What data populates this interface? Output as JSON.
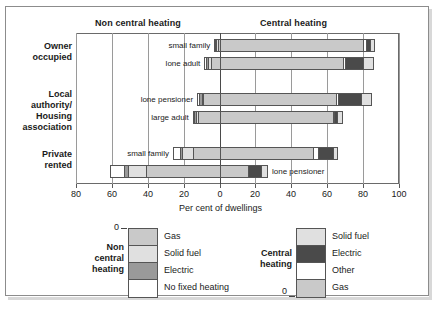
{
  "header": {
    "left_band": "Non central heating",
    "right_band": "Central heating"
  },
  "axis": {
    "title": "Per cent of dwellings",
    "ticks": [
      "80",
      "60",
      "40",
      "20",
      "0",
      "20",
      "40",
      "60",
      "80",
      "100"
    ]
  },
  "categories": [
    {
      "label_lines": [
        "Owner",
        "occupied"
      ]
    },
    {
      "label_lines": [
        "Local",
        "authority/",
        "Housing",
        "association"
      ]
    },
    {
      "label_lines": [
        "Private",
        "rented"
      ]
    }
  ],
  "bar_labels": [
    "small family",
    "lone adult",
    "lone pensioner",
    "large adult",
    "small family",
    "lone pensioner"
  ],
  "legends": {
    "left": {
      "name_lines": [
        "Non",
        "central",
        "heating"
      ],
      "zero_label": "0",
      "items": [
        {
          "label": "Gas",
          "color": "#c9c9c9"
        },
        {
          "label": "Solid fuel",
          "color": "#e0e0e0"
        },
        {
          "label": "Electric",
          "color": "#9a9a9a"
        },
        {
          "label": "No fixed heating",
          "color": "#ffffff"
        }
      ]
    },
    "right": {
      "name_lines": [
        "Central",
        "heating"
      ],
      "zero_label": "0",
      "items": [
        {
          "label": "Solid fuel",
          "color": "#e0e0e0"
        },
        {
          "label": "Electric",
          "color": "#4a4a4a"
        },
        {
          "label": "Other",
          "color": "#ffffff"
        },
        {
          "label": "Gas",
          "color": "#c9c9c9"
        }
      ]
    }
  },
  "chart_data": {
    "type": "bar",
    "orientation": "horizontal",
    "layout": "diverging-stacked",
    "title": "",
    "xlabel": "Per cent of dwellings",
    "ylabel": "",
    "grid": true,
    "legend_position": "below",
    "xlim_left": [
      0,
      80
    ],
    "xlim_right": [
      0,
      100
    ],
    "x_ticks": [
      -80,
      -60,
      -40,
      -20,
      0,
      20,
      40,
      60,
      80,
      100
    ],
    "x_tick_labels": [
      "80",
      "60",
      "40",
      "20",
      "0",
      "20",
      "40",
      "60",
      "80",
      "100"
    ],
    "groups": [
      "Owner occupied",
      "Local authority/ Housing association",
      "Private rented"
    ],
    "rows": [
      {
        "group": "Owner occupied",
        "household": "small family",
        "non_central_heating": {
          "No fixed heating": 0.5,
          "Electric": 0.5,
          "Solid fuel": 1.0,
          "Gas": 1.0
        },
        "central_heating": {
          "Gas": 80.0,
          "Other": 1.5,
          "Electric": 2.0,
          "Solid fuel": 3.0
        }
      },
      {
        "group": "Owner occupied",
        "household": "lone adult",
        "non_central_heating": {
          "No fixed heating": 1.0,
          "Electric": 1.0,
          "Solid fuel": 1.5,
          "Gas": 5.0
        },
        "central_heating": {
          "Gas": 69.0,
          "Other": 1.0,
          "Electric": 10.0,
          "Solid fuel": 6.0
        }
      },
      {
        "group": "Local authority/ Housing association",
        "household": "lone pensioner",
        "non_central_heating": {
          "No fixed heating": 1.0,
          "Electric": 1.5,
          "Solid fuel": 1.0,
          "Gas": 9.0
        },
        "central_heating": {
          "Gas": 65.0,
          "Other": 1.0,
          "Electric": 13.0,
          "Solid fuel": 6.0
        }
      },
      {
        "group": "Local authority/ Housing association",
        "household": "large adult",
        "non_central_heating": {
          "No fixed heating": 1.0,
          "Electric": 1.0,
          "Solid fuel": 1.0,
          "Gas": 12.0
        },
        "central_heating": {
          "Gas": 63.0,
          "Other": 0.5,
          "Electric": 2.0,
          "Solid fuel": 3.0
        }
      },
      {
        "group": "Private rented",
        "household": "small family",
        "non_central_heating": {
          "No fixed heating": 4.0,
          "Electric": 1.0,
          "Solid fuel": 6.0,
          "Gas": 15.0
        },
        "central_heating": {
          "Gas": 52.0,
          "Other": 3.0,
          "Electric": 8.0,
          "Solid fuel": 3.0
        }
      },
      {
        "group": "Private rented",
        "household": "lone pensioner",
        "non_central_heating": {
          "No fixed heating": 8.0,
          "Electric": 2.0,
          "Solid fuel": 10.0,
          "Gas": 41.0
        },
        "central_heating": {
          "Gas": 16.0,
          "Electric": 7.0,
          "Solid fuel": 4.0
        }
      }
    ],
    "series_order_left": [
      "No fixed heating",
      "Electric",
      "Solid fuel",
      "Gas"
    ],
    "series_order_right": [
      "Gas",
      "Other",
      "Electric",
      "Solid fuel"
    ],
    "colors": {
      "Gas": "#c9c9c9",
      "Solid fuel": "#e0e0e0",
      "Electric_non_central": "#9a9a9a",
      "Electric_central": "#4a4a4a",
      "No fixed heating": "#ffffff",
      "Other": "#ffffff"
    }
  }
}
